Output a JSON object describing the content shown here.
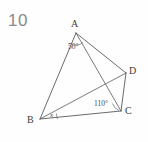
{
  "question": {
    "number": "10"
  },
  "figure": {
    "type": "geometry-diagram",
    "stroke_color": "#5a5a5a",
    "background_color": "#fefefe",
    "vertices": [
      {
        "id": "A",
        "label": "A",
        "x": 76,
        "y": 33
      },
      {
        "id": "B",
        "label": "B",
        "x": 40,
        "y": 119
      },
      {
        "id": "C",
        "label": "C",
        "x": 121,
        "y": 111
      },
      {
        "id": "D",
        "label": "D",
        "x": 126,
        "y": 73
      }
    ],
    "segments": [
      {
        "name": "side-AB",
        "from": "A",
        "to": "B"
      },
      {
        "name": "side-BC",
        "from": "B",
        "to": "C"
      },
      {
        "name": "side-CD",
        "from": "C",
        "to": "D"
      },
      {
        "name": "side-DA",
        "from": "D",
        "to": "A"
      },
      {
        "name": "diagonal-AC",
        "from": "A",
        "to": "C"
      },
      {
        "name": "diagonal-BD",
        "from": "B",
        "to": "D"
      }
    ],
    "angles": [
      {
        "name": "angle-at-A",
        "vertex": "A",
        "label": "50°"
      },
      {
        "name": "angle-at-C",
        "vertex": "C",
        "label": "110°"
      },
      {
        "name": "angle-at-B",
        "vertex": "B",
        "label": "x"
      }
    ]
  }
}
